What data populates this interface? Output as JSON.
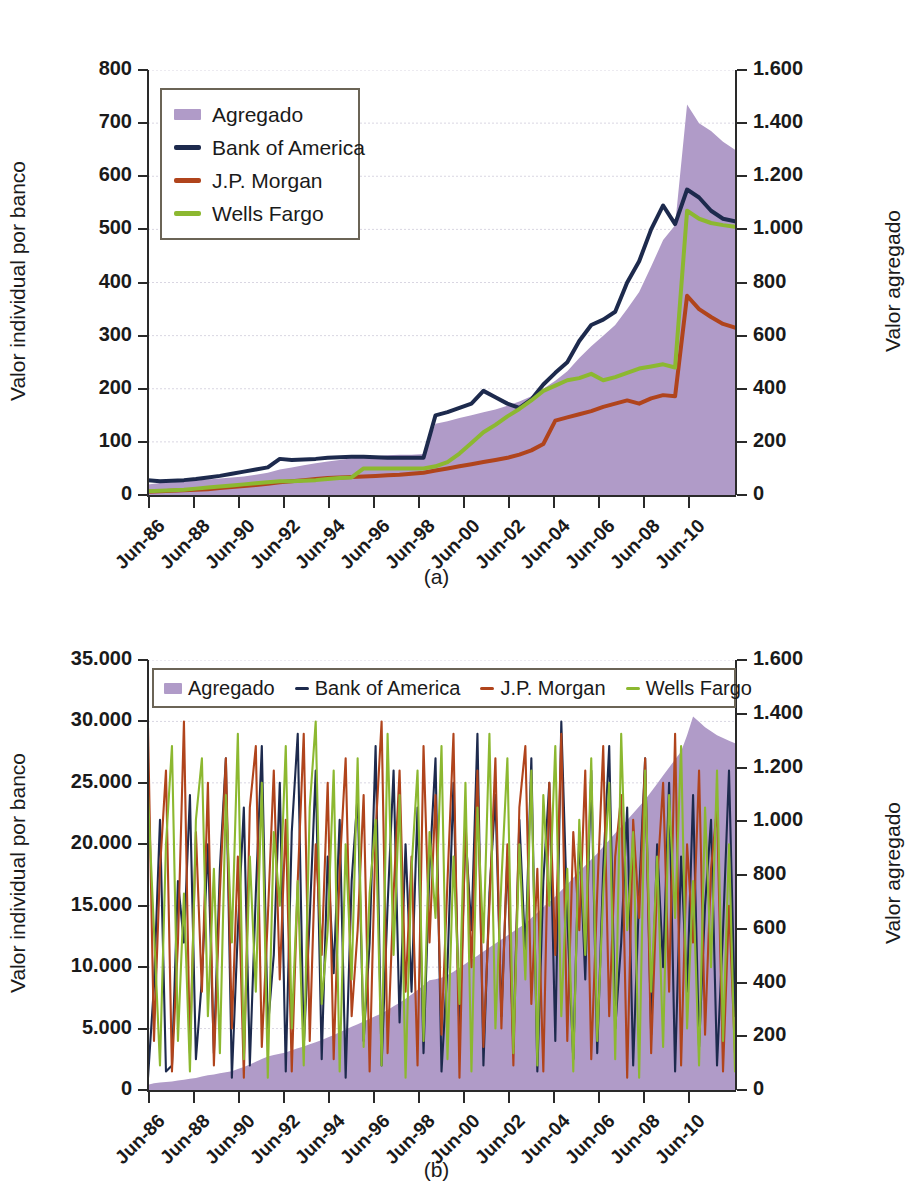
{
  "figure": {
    "panels": [
      {
        "id": "a",
        "caption": "(a)",
        "legend_orientation": "vertical",
        "left_axis_label": "Valor individual por banco",
        "right_axis_label": "Valor agregado"
      },
      {
        "id": "b",
        "caption": "(b)",
        "legend_orientation": "horizontal",
        "left_axis_label": "Valor individual por banco",
        "right_axis_label": "Valor agregado"
      }
    ]
  },
  "colors": {
    "aggregate": "#b09bc8",
    "bank_of_america": "#1d2a4d",
    "jp_morgan": "#b0441c",
    "wells_fargo": "#8cb830",
    "axis": "#2a2a2a",
    "grid": "#d9d6e2",
    "legend_border": "#6b6456"
  },
  "series_names": {
    "aggregate": "Agregado",
    "bank_of_america": "Bank of America",
    "jp_morgan": "J.P. Morgan",
    "wells_fargo": "Wells Fargo"
  },
  "chart_data": [
    {
      "type": "area",
      "panel": "a",
      "title": "",
      "xlabel": "",
      "ylabel": "Valor individual por banco",
      "y2label": "Valor agregado",
      "ylim": [
        0,
        800
      ],
      "y2lim": [
        0,
        1600
      ],
      "yticks": [
        "0",
        "100",
        "200",
        "300",
        "400",
        "500",
        "600",
        "700",
        "800"
      ],
      "y2ticks": [
        "0",
        "200",
        "400",
        "600",
        "800",
        "1.000",
        "1.200",
        "1.400",
        "1.600"
      ],
      "xticks": [
        "Jun-86",
        "Jun-88",
        "Jun-90",
        "Jun-92",
        "Jun-94",
        "Jun-96",
        "Jun-98",
        "Jun-00",
        "Jun-02",
        "Jun-04",
        "Jun-06",
        "Jun-08",
        "Jun-10"
      ],
      "xlim": [
        "Jun-86",
        "Jun-11"
      ],
      "grid": true,
      "legend_position": "upper-left-inside",
      "legend": [
        "Agregado",
        "Bank of America",
        "J.P. Morgan",
        "Wells Fargo"
      ],
      "x": [
        1986.5,
        1987.0,
        1987.5,
        1988.0,
        1988.5,
        1989.0,
        1989.5,
        1990.0,
        1990.5,
        1991.0,
        1991.5,
        1992.0,
        1992.5,
        1993.0,
        1993.5,
        1994.0,
        1994.5,
        1995.0,
        1995.5,
        1996.0,
        1996.5,
        1997.0,
        1997.5,
        1998.0,
        1998.5,
        1999.0,
        1999.5,
        2000.0,
        2000.5,
        2001.0,
        2001.5,
        2002.0,
        2002.5,
        2003.0,
        2003.5,
        2004.0,
        2004.5,
        2005.0,
        2005.5,
        2006.0,
        2006.5,
        2007.0,
        2007.5,
        2008.0,
        2008.5,
        2009.0,
        2009.5,
        2010.0,
        2010.5,
        2011.0
      ],
      "series": [
        {
          "name": "Agregado",
          "axis": "right",
          "kind": "area",
          "values": [
            40,
            45,
            48,
            52,
            55,
            58,
            62,
            66,
            70,
            76,
            84,
            96,
            104,
            112,
            120,
            126,
            132,
            138,
            142,
            146,
            150,
            152,
            152,
            154,
            268,
            278,
            290,
            300,
            312,
            322,
            336,
            352,
            372,
            400,
            430,
            466,
            516,
            560,
            600,
            640,
            700,
            764,
            860,
            960,
            1016,
            1470,
            1400,
            1370,
            1330,
            1300
          ]
        },
        {
          "name": "Bank of America",
          "axis": "left",
          "kind": "line",
          "values": [
            28,
            26,
            27,
            28,
            30,
            33,
            36,
            40,
            44,
            48,
            52,
            68,
            66,
            67,
            68,
            70,
            71,
            72,
            72,
            71,
            70,
            70,
            70,
            70,
            150,
            156,
            164,
            172,
            196,
            184,
            172,
            164,
            180,
            208,
            230,
            250,
            290,
            320,
            330,
            345,
            400,
            440,
            500,
            545,
            510,
            575,
            560,
            535,
            520,
            515
          ]
        },
        {
          "name": "J.P. Morgan",
          "axis": "left",
          "kind": "line",
          "values": [
            6,
            7,
            8,
            9,
            10,
            11,
            13,
            15,
            17,
            19,
            21,
            24,
            26,
            28,
            30,
            32,
            33,
            34,
            35,
            36,
            37,
            38,
            40,
            42,
            46,
            50,
            54,
            58,
            62,
            66,
            70,
            76,
            84,
            96,
            140,
            146,
            152,
            158,
            166,
            172,
            178,
            172,
            182,
            188,
            186,
            375,
            350,
            335,
            322,
            315
          ]
        },
        {
          "name": "Wells Fargo",
          "axis": "left",
          "kind": "line",
          "values": [
            7,
            8,
            9,
            10,
            12,
            14,
            16,
            18,
            20,
            22,
            24,
            26,
            26,
            27,
            28,
            30,
            32,
            33,
            50,
            50,
            50,
            50,
            50,
            50,
            54,
            62,
            78,
            98,
            118,
            132,
            148,
            162,
            178,
            196,
            206,
            216,
            220,
            228,
            216,
            222,
            230,
            238,
            242,
            246,
            240,
            535,
            520,
            512,
            508,
            505
          ]
        }
      ]
    },
    {
      "type": "line",
      "panel": "b",
      "title": "",
      "xlabel": "",
      "ylabel": "Valor individual por banco",
      "y2label": "Valor agregado",
      "ylim": [
        0,
        35000
      ],
      "y2lim": [
        0,
        1600
      ],
      "yticks": [
        "0",
        "5.000",
        "10.000",
        "15.000",
        "20.000",
        "25.000",
        "30.000",
        "35.000"
      ],
      "y2ticks": [
        "0",
        "200",
        "400",
        "600",
        "800",
        "1.000",
        "1.200",
        "1.400",
        "1.600"
      ],
      "xticks": [
        "Jun-86",
        "Jun-88",
        "Jun-90",
        "Jun-92",
        "Jun-94",
        "Jun-96",
        "Jun-98",
        "Jun-00",
        "Jun-02",
        "Jun-04",
        "Jun-06",
        "Jun-08",
        "Jun-10"
      ],
      "xlim": [
        "Jun-86",
        "Jun-11"
      ],
      "grid": true,
      "legend_position": "top-inside",
      "legend": [
        "Agregado",
        "Bank of America",
        "J.P. Morgan",
        "Wells Fargo"
      ],
      "x": [
        1986.5,
        1986.75,
        1987.0,
        1987.25,
        1987.5,
        1987.75,
        1988.0,
        1988.25,
        1988.5,
        1988.75,
        1989.0,
        1989.25,
        1989.5,
        1989.75,
        1990.0,
        1990.25,
        1990.5,
        1990.75,
        1991.0,
        1991.25,
        1991.5,
        1991.75,
        1992.0,
        1992.25,
        1992.5,
        1992.75,
        1993.0,
        1993.25,
        1993.5,
        1993.75,
        1994.0,
        1994.25,
        1994.5,
        1994.75,
        1995.0,
        1995.25,
        1995.5,
        1995.75,
        1996.0,
        1996.25,
        1996.5,
        1996.75,
        1997.0,
        1997.25,
        1997.5,
        1997.75,
        1998.0,
        1998.25,
        1998.5,
        1998.75,
        1999.0,
        1999.25,
        1999.5,
        1999.75,
        2000.0,
        2000.25,
        2000.5,
        2000.75,
        2001.0,
        2001.25,
        2001.5,
        2001.75,
        2002.0,
        2002.25,
        2002.5,
        2002.75,
        2003.0,
        2003.25,
        2003.5,
        2003.75,
        2004.0,
        2004.25,
        2004.5,
        2004.75,
        2005.0,
        2005.25,
        2005.5,
        2005.75,
        2006.0,
        2006.25,
        2006.5,
        2006.75,
        2007.0,
        2007.25,
        2007.5,
        2007.75,
        2008.0,
        2008.25,
        2008.5,
        2008.75,
        2009.0,
        2009.25,
        2009.5,
        2009.75,
        2010.0,
        2010.25,
        2010.5,
        2010.75,
        2011.0
      ],
      "series": [
        {
          "name": "Agregado",
          "axis": "right",
          "kind": "area",
          "values": [
            20,
            25,
            28,
            30,
            32,
            35,
            38,
            42,
            45,
            50,
            55,
            58,
            62,
            66,
            70,
            78,
            86,
            95,
            105,
            115,
            125,
            130,
            135,
            140,
            148,
            155,
            162,
            170,
            178,
            186,
            195,
            205,
            215,
            225,
            235,
            245,
            255,
            265,
            275,
            285,
            298,
            312,
            325,
            340,
            355,
            372,
            390,
            408,
            412,
            418,
            428,
            440,
            455,
            470,
            486,
            500,
            515,
            530,
            545,
            560,
            575,
            590,
            605,
            620,
            640,
            660,
            680,
            700,
            720,
            742,
            765,
            790,
            812,
            835,
            858,
            880,
            905,
            930,
            955,
            980,
            1005,
            1030,
            1055,
            1080,
            1110,
            1140,
            1170,
            1200,
            1230,
            1260,
            1320,
            1390,
            1370,
            1350,
            1335,
            1320,
            1310,
            1300,
            1290
          ]
        },
        {
          "name": "Bank of America",
          "axis": "left",
          "kind": "line",
          "values": [
            1000,
            8500,
            22000,
            1500,
            2000,
            17000,
            12000,
            24000,
            2500,
            9000,
            20000,
            3000,
            18000,
            27000,
            1000,
            13000,
            23000,
            2000,
            16000,
            28000,
            5000,
            11000,
            25000,
            1500,
            21000,
            29000,
            3500,
            14000,
            26000,
            2500,
            19000,
            9500,
            22000,
            1000,
            17000,
            24000,
            4000,
            12000,
            28000,
            2000,
            15000,
            26000,
            5500,
            20000,
            8000,
            23000,
            3000,
            18000,
            27000,
            1500,
            10000,
            25000,
            4500,
            21000,
            13000,
            29000,
            2000,
            16000,
            24000,
            6000,
            19000,
            3500,
            22000,
            11000,
            27000,
            1500,
            17000,
            25000,
            4000,
            30000,
            14000,
            2500,
            21000,
            9000,
            26000,
            3000,
            18000,
            28000,
            5000,
            12000,
            23000,
            2000,
            16000,
            27000,
            4500,
            20000,
            10000,
            25000,
            1500,
            19000,
            8000,
            24000,
            3500,
            15000,
            22000,
            2000,
            13000,
            26000,
            6000
          ]
        },
        {
          "name": "J.P. Morgan",
          "axis": "left",
          "kind": "line",
          "values": [
            29500,
            4000,
            18000,
            26000,
            1500,
            12000,
            30000,
            3000,
            21000,
            8000,
            25000,
            2000,
            16000,
            27000,
            5000,
            19000,
            1000,
            23000,
            28000,
            3500,
            14000,
            26000,
            9000,
            22000,
            1500,
            17000,
            29000,
            4000,
            20000,
            11000,
            25000,
            2500,
            18000,
            27000,
            6000,
            13000,
            24000,
            1500,
            21000,
            30000,
            3000,
            16000,
            26000,
            8000,
            19000,
            2000,
            28000,
            12000,
            24000,
            4500,
            17000,
            29000,
            1000,
            22000,
            10000,
            26000,
            3500,
            15000,
            27000,
            5000,
            20000,
            2000,
            23000,
            28000,
            7000,
            18000,
            1500,
            25000,
            11000,
            29000,
            4000,
            21000,
            13000,
            26000,
            2500,
            16000,
            28000,
            6000,
            19000,
            24000,
            1000,
            22000,
            14000,
            27000,
            3000,
            17000,
            25000,
            8000,
            29000,
            2000,
            20000,
            12000,
            26000,
            4500,
            18000,
            23000,
            1500,
            15000,
            3000
          ]
        },
        {
          "name": "Wells Fargo",
          "axis": "left",
          "kind": "line",
          "values": [
            24000,
            13000,
            2000,
            20000,
            28000,
            4000,
            16000,
            1500,
            22000,
            27000,
            6000,
            18000,
            3000,
            24000,
            12000,
            29000,
            2500,
            19000,
            8000,
            25000,
            1000,
            21000,
            15000,
            28000,
            5000,
            17000,
            2000,
            23000,
            30000,
            7000,
            13000,
            26000,
            1500,
            20000,
            9000,
            27000,
            3500,
            16000,
            22000,
            2000,
            29000,
            11000,
            24000,
            1000,
            18000,
            26000,
            4000,
            21000,
            14000,
            28000,
            2500,
            19000,
            7000,
            25000,
            1500,
            23000,
            12000,
            29000,
            5000,
            17000,
            27000,
            3000,
            20000,
            9000,
            26000,
            2000,
            24000,
            15000,
            28000,
            6000,
            18000,
            1500,
            22000,
            11000,
            27000,
            4000,
            16000,
            25000,
            2500,
            29000,
            13000,
            21000,
            1000,
            26000,
            8000,
            19000,
            3500,
            24000,
            14000,
            28000,
            5000,
            17000,
            2000,
            23000,
            10000,
            26000,
            4000,
            20000,
            1500
          ]
        }
      ]
    }
  ]
}
